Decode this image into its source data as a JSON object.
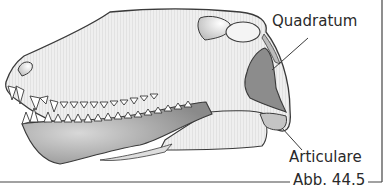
{
  "figure": {
    "labels": {
      "quadratum": "Quadratum",
      "articulare": "Articulare"
    },
    "caption": "Abb. 44.5",
    "colors": {
      "skull_fill": "#ececec",
      "outline": "#3a3a3a",
      "quadratum_fill": "#8c8c8c",
      "articulare_fill": "#c4c4c4",
      "dentary_fill": "#9a9a9a",
      "frame": "#444444"
    }
  }
}
